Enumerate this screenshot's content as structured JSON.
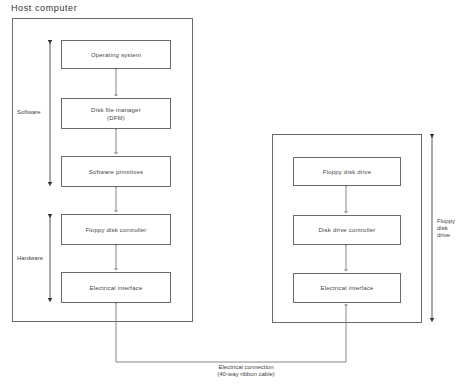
{
  "diagram": {
    "host": {
      "title": "Host computer",
      "boxes": [
        {
          "label": "Operating system",
          "sub": ""
        },
        {
          "label": "Disk file manager",
          "sub": "(DFM)"
        },
        {
          "label": "Software primitives",
          "sub": ""
        },
        {
          "label": "Floppy disk controller",
          "sub": ""
        },
        {
          "label": "Electrical interface",
          "sub": ""
        }
      ],
      "groups": {
        "software": "Software",
        "hardware": "Hardware"
      }
    },
    "drive": {
      "boxes": [
        {
          "label": "Floppy disk drive"
        },
        {
          "label": "Disk drive controller"
        },
        {
          "label": "Electrical interface"
        }
      ],
      "label_line1": "Floppy",
      "label_line2": "disk",
      "label_line3": "drive"
    },
    "connection": {
      "line1": "Electrical connection",
      "line2": "(40-way ribbon cable)"
    },
    "colors": {
      "line": "#6a6a6a",
      "text": "#444444",
      "background": "#ffffff"
    }
  }
}
